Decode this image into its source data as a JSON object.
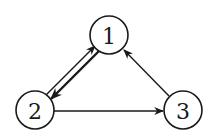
{
  "diagram": {
    "type": "directed-graph",
    "colors": {
      "stroke": "#1a1a1a",
      "background": "#ffffff"
    },
    "nodes": [
      {
        "id": "1",
        "label": "1",
        "cx": 109,
        "cy": 35,
        "r": 19
      },
      {
        "id": "2",
        "label": "2",
        "cx": 35,
        "cy": 110,
        "r": 19
      },
      {
        "id": "3",
        "label": "3",
        "cx": 183,
        "cy": 110,
        "r": 19
      }
    ],
    "edges": [
      {
        "from": "2",
        "to": "1",
        "style": "thin"
      },
      {
        "from": "1",
        "to": "2",
        "style": "thick"
      },
      {
        "from": "2",
        "to": "3",
        "style": "thin"
      },
      {
        "from": "3",
        "to": "1",
        "style": "thin"
      }
    ]
  }
}
